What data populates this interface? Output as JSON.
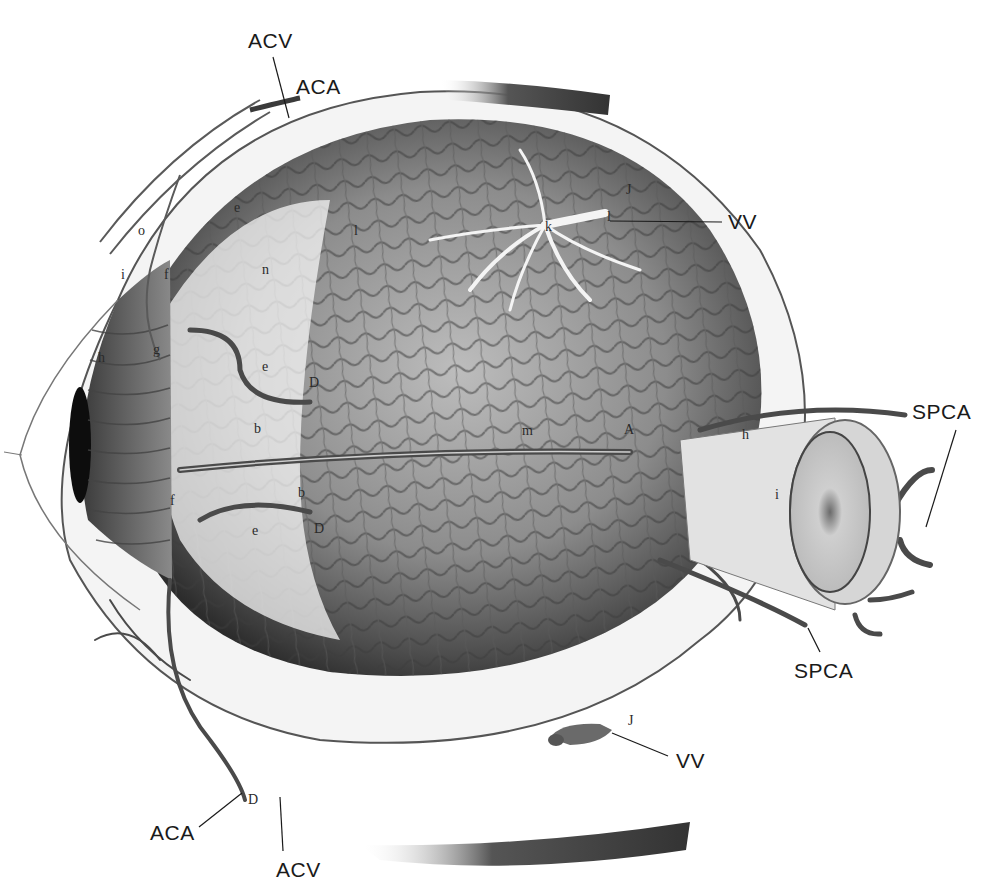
{
  "figure": {
    "colors": {
      "background": "#ffffff",
      "ink": "#1a1a1a",
      "choroid_dark": "#3a3a3a",
      "choroid_mid": "#7a7a7a",
      "vessel": "#4a4a4a",
      "sclera": "#f2f2f2"
    }
  },
  "labels": {
    "main": [
      {
        "id": "acv_top",
        "text": "ACV",
        "x": 248,
        "y": 30
      },
      {
        "id": "aca_top",
        "text": "ACA",
        "x": 296,
        "y": 78
      },
      {
        "id": "vv_top",
        "text": "VV",
        "x": 728,
        "y": 213
      },
      {
        "id": "spca_right",
        "text": "SPCA",
        "x": 912,
        "y": 403
      },
      {
        "id": "spca_bottom",
        "text": "SPCA",
        "x": 794,
        "y": 662
      },
      {
        "id": "vv_bottom",
        "text": "VV",
        "x": 676,
        "y": 752
      },
      {
        "id": "aca_bottom",
        "text": "ACA",
        "x": 150,
        "y": 822
      },
      {
        "id": "acv_bottom",
        "text": "ACV",
        "x": 276,
        "y": 859
      }
    ],
    "letters": [
      {
        "id": "J_top",
        "text": "J",
        "x": 626,
        "y": 185
      },
      {
        "id": "k",
        "text": "k",
        "x": 545,
        "y": 222
      },
      {
        "id": "l",
        "text": "l",
        "x": 607,
        "y": 212
      },
      {
        "id": "e_1",
        "text": "e",
        "x": 234,
        "y": 203
      },
      {
        "id": "l_2",
        "text": "l",
        "x": 354,
        "y": 226
      },
      {
        "id": "o",
        "text": "o",
        "x": 138,
        "y": 226
      },
      {
        "id": "i_1",
        "text": "i",
        "x": 121,
        "y": 270
      },
      {
        "id": "f_1",
        "text": "f",
        "x": 164,
        "y": 270
      },
      {
        "id": "n",
        "text": "n",
        "x": 262,
        "y": 265
      },
      {
        "id": "h_1",
        "text": "h",
        "x": 98,
        "y": 353
      },
      {
        "id": "g",
        "text": "g",
        "x": 153,
        "y": 345
      },
      {
        "id": "e_2",
        "text": "e",
        "x": 262,
        "y": 362
      },
      {
        "id": "D_1",
        "text": "D",
        "x": 309,
        "y": 378
      },
      {
        "id": "b_1",
        "text": "b",
        "x": 254,
        "y": 424
      },
      {
        "id": "m",
        "text": "m",
        "x": 522,
        "y": 426
      },
      {
        "id": "A",
        "text": "A",
        "x": 624,
        "y": 425
      },
      {
        "id": "h_2",
        "text": "h",
        "x": 742,
        "y": 430
      },
      {
        "id": "i_2",
        "text": "i",
        "x": 775,
        "y": 490
      },
      {
        "id": "f_2",
        "text": "f",
        "x": 170,
        "y": 496
      },
      {
        "id": "b_2",
        "text": "b",
        "x": 298,
        "y": 488
      },
      {
        "id": "D_2",
        "text": "D",
        "x": 314,
        "y": 524
      },
      {
        "id": "e_3",
        "text": "e",
        "x": 252,
        "y": 526
      },
      {
        "id": "J_bottom",
        "text": "J",
        "x": 628,
        "y": 716
      },
      {
        "id": "D_3",
        "text": "D",
        "x": 248,
        "y": 795
      }
    ]
  },
  "leader_lines": [
    {
      "id": "acv_top_line",
      "x1": 273,
      "y1": 57,
      "x2": 289,
      "y2": 118
    },
    {
      "id": "aca_top_line",
      "x1": 312,
      "y1": 100,
      "x2": 309,
      "y2": 102
    },
    {
      "id": "vv_top_line",
      "x1": 610,
      "y1": 221,
      "x2": 722,
      "y2": 222
    },
    {
      "id": "spca_right_line",
      "x1": 956,
      "y1": 430,
      "x2": 926,
      "y2": 527
    },
    {
      "id": "spca_bottom_line",
      "x1": 808,
      "y1": 628,
      "x2": 820,
      "y2": 652
    },
    {
      "id": "vv_bottom_line",
      "x1": 612,
      "y1": 733,
      "x2": 668,
      "y2": 756
    },
    {
      "id": "aca_bottom_line",
      "x1": 199,
      "y1": 827,
      "x2": 242,
      "y2": 793
    },
    {
      "id": "acv_bottom_line",
      "x1": 283,
      "y1": 851,
      "x2": 280,
      "y2": 797
    }
  ]
}
